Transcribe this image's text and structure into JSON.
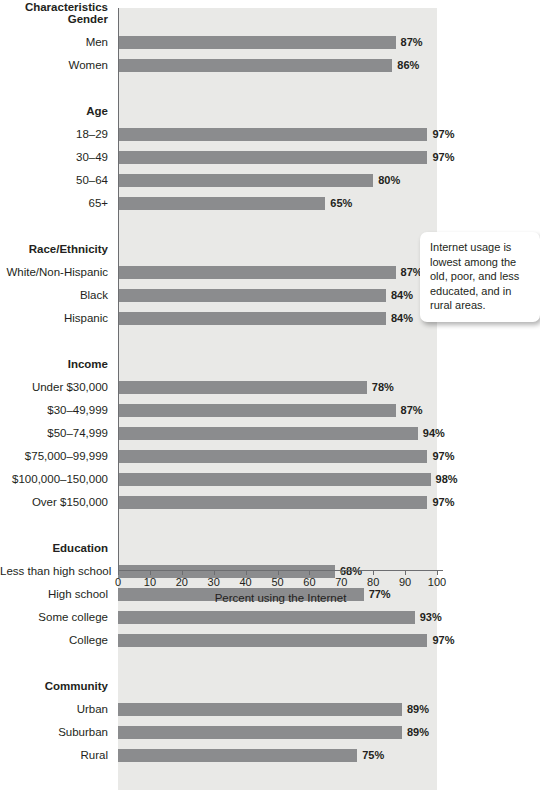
{
  "chart_data": {
    "type": "bar",
    "orientation": "horizontal",
    "title": "Characteristics",
    "xlabel": "Percent using the Internet",
    "ylabel": "",
    "xlim": [
      0,
      100
    ],
    "xticks": [
      0,
      10,
      20,
      30,
      40,
      50,
      60,
      70,
      80,
      90,
      100
    ],
    "grid": false,
    "legend": null,
    "value_suffix": "%",
    "groups": [
      {
        "name": "Gender",
        "categories": [
          "Men",
          "Women"
        ],
        "values": [
          87,
          86
        ],
        "labels": [
          "87%",
          "86%"
        ]
      },
      {
        "name": "Age",
        "categories": [
          "18–29",
          "30–49",
          "50–64",
          "65+"
        ],
        "values": [
          97,
          97,
          80,
          65
        ],
        "labels": [
          "97%",
          "97%",
          "80%",
          "65%"
        ]
      },
      {
        "name": "Race/Ethnicity",
        "categories": [
          "White/Non-Hispanic",
          "Black",
          "Hispanic"
        ],
        "values": [
          87,
          84,
          84
        ],
        "labels": [
          "87%",
          "84%",
          "84%"
        ]
      },
      {
        "name": "Income",
        "categories": [
          "Under $30,000",
          "$30–49,999",
          "$50–74,999",
          "$75,000–99,999",
          "$100,000–150,000",
          "Over $150,000"
        ],
        "values": [
          78,
          87,
          94,
          97,
          98,
          97
        ],
        "labels": [
          "78%",
          "87%",
          "94%",
          "97%",
          "98%",
          "97%"
        ]
      },
      {
        "name": "Education",
        "categories": [
          "Less than high school",
          "High school",
          "Some college",
          "College"
        ],
        "values": [
          68,
          77,
          93,
          97
        ],
        "labels": [
          "68%",
          "77%",
          "93%",
          "97%"
        ]
      },
      {
        "name": "Community",
        "categories": [
          "Urban",
          "Suburban",
          "Rural"
        ],
        "values": [
          89,
          89,
          75
        ],
        "labels": [
          "89%",
          "89%",
          "75%"
        ]
      }
    ],
    "annotations": [
      {
        "name": "callout",
        "text": "Internet usage is lowest among the old, poor, and less educated, and in rural areas."
      }
    ],
    "colors": {
      "bar": "#8b8c8e",
      "plot_background": "#e9e9e7",
      "page_background": "#ffffff",
      "text": "#231f20",
      "axis": "#6d6e71",
      "callout_background": "#ffffff"
    }
  }
}
